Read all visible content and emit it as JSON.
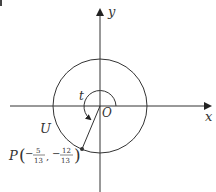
{
  "diagram": {
    "type": "unit-circle",
    "labels": {
      "x_axis": "x",
      "y_axis": "y",
      "origin": "O",
      "angle": "t",
      "circle": "U",
      "point": "P"
    },
    "point": {
      "name": "P",
      "x_num": "5",
      "x_den": "13",
      "x_sign": "−",
      "y_num": "12",
      "y_den": "13",
      "y_sign": "−",
      "coords": [
        -0.3846,
        -0.9231
      ]
    },
    "colors": {
      "stroke": "#333333",
      "background": "#ffffff"
    }
  }
}
